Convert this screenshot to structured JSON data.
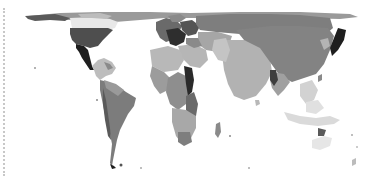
{
  "map": {
    "type": "cartogram",
    "style": "grayscale",
    "title": "",
    "colors": {
      "background": "#ffffff",
      "darkest": "#1e1e1e",
      "dark": "#3a3a3a",
      "mid_dark": "#5e5e5e",
      "mid": "#7a7a7a",
      "light": "#a3a3a3",
      "lighter": "#bdbdbd",
      "lightest": "#d6d6d6",
      "edge_dots": "#c8c8c8"
    },
    "regions": [
      {
        "name": "Canada",
        "shade": "mid_dark"
      },
      {
        "name": "United States",
        "shade": "dark"
      },
      {
        "name": "Mexico",
        "shade": "darkest"
      },
      {
        "name": "Central America & Caribbean",
        "shade": "lighter"
      },
      {
        "name": "South America",
        "shade": "mid"
      },
      {
        "name": "Europe",
        "shade": "dark"
      },
      {
        "name": "Russia",
        "shade": "mid"
      },
      {
        "name": "Middle East",
        "shade": "light"
      },
      {
        "name": "Africa",
        "shade": "light"
      },
      {
        "name": "East Africa",
        "shade": "darkest"
      },
      {
        "name": "India",
        "shade": "lighter"
      },
      {
        "name": "China",
        "shade": "mid"
      },
      {
        "name": "Japan",
        "shade": "darkest"
      },
      {
        "name": "Southeast Asia",
        "shade": "lightest"
      },
      {
        "name": "Oceania",
        "shade": "lightest"
      }
    ]
  }
}
